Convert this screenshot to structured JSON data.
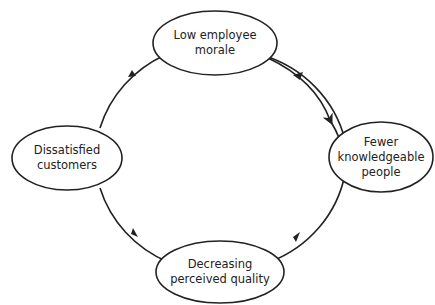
{
  "diagram": {
    "type": "cycle",
    "nodes": [
      {
        "id": "top",
        "line1": "Low employee",
        "line2": "morale",
        "line3": ""
      },
      {
        "id": "right",
        "line1": "Fewer",
        "line2": "knowledgeable",
        "line3": "people"
      },
      {
        "id": "bottom",
        "line1": "Decreasing",
        "line2": "perceived quality",
        "line3": ""
      },
      {
        "id": "left",
        "line1": "Dissatisfied",
        "line2": "customers",
        "line3": ""
      }
    ],
    "edges": [
      {
        "from": "top",
        "to": "right"
      },
      {
        "from": "right",
        "to": "bottom"
      },
      {
        "from": "bottom",
        "to": "left"
      },
      {
        "from": "left",
        "to": "top"
      }
    ],
    "colors": {
      "stroke": "#222222",
      "background": "#ffffff"
    }
  }
}
